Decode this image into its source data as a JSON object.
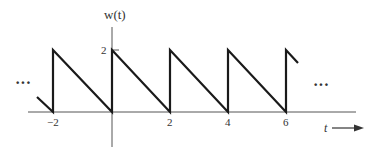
{
  "figure": {
    "y_axis_label": "w(t)",
    "x_axis_label": "t",
    "y_tick_label": "2",
    "x_tick_labels": [
      "−2",
      "2",
      "4",
      "6"
    ],
    "ellipsis_left": "···",
    "ellipsis_right": "···",
    "colors": {
      "line": "#1a1a1a",
      "axis": "#555555",
      "text": "#333333"
    }
  },
  "signal": {
    "type": "periodic sawtooth",
    "period": 2,
    "peak_value": 2,
    "description": "Jumps to 2 at each even t, decreases linearly to 0 at next even t",
    "visible_range": [
      -2.5,
      6.4
    ]
  }
}
